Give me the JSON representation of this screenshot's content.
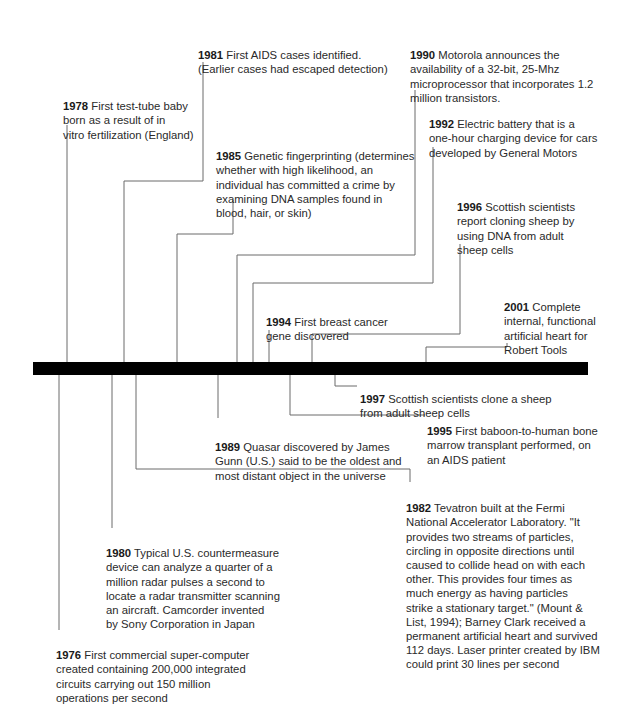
{
  "timeline": {
    "bar_color": "#000000",
    "line_color": "#6a6a6a",
    "events": [
      {
        "year": "1976",
        "text": "First commercial super-computer\ncreated containing 200,000 integrated\ncircuits carrying out 150 million\noperations per second"
      },
      {
        "year": "1978",
        "text": "First test-tube baby\nborn as a result of in\nvitro fertilization (England)"
      },
      {
        "year": "1980",
        "text": "Typical U.S. countermeasure\ndevice can analyze a quarter of a\nmillion radar pulses a second to\nlocate a radar transmitter scanning\nan aircraft. Camcorder invented\nby Sony Corporation in Japan"
      },
      {
        "year": "1981",
        "text": "First AIDS cases identified.\n(Earlier cases had escaped detection)"
      },
      {
        "year": "1982",
        "text": "Tevatron built at the Fermi\nNational Accelerator Laboratory. \"It\nprovides two streams of particles,\ncircling in opposite directions until\ncaused to collide head on with each\nother. This provides four times as\nmuch energy as having particles\nstrike a stationary target.\" (Mount &\nList, 1994); Barney Clark received a\npermanent artificial heart and survived\n112 days.  Laser printer created by IBM\ncould print 30 lines per second"
      },
      {
        "year": "1985",
        "text": "Genetic fingerprinting (determines\nwhether with high likelihood, an\nindividual has committed a crime by\nexamining DNA samples found in\nblood, hair, or skin)"
      },
      {
        "year": "1989",
        "text": "Quasar discovered by James\nGunn (U.S.) said to be the oldest and\nmost distant object in the universe"
      },
      {
        "year": "1990",
        "text": "Motorola announces the\navailability of a 32-bit, 25-Mhz\nmicroprocessor that incorporates 1.2\nmillion transistors."
      },
      {
        "year": "1992",
        "text": "Electric battery that is a\none-hour charging device for cars\ndeveloped by General Motors"
      },
      {
        "year": "1994",
        "text": "First breast cancer\ngene discovered"
      },
      {
        "year": "1995",
        "text": "First baboon-to-human bone\nmarrow transplant performed, on\nan AIDS patient"
      },
      {
        "year": "1996",
        "text": "Scottish scientists\nreport cloning sheep by\nusing DNA from adult\nsheep cells"
      },
      {
        "year": "1997",
        "text": "Scottish scientists clone a sheep\nfrom adult sheep cells"
      },
      {
        "year": "2001",
        "text": "Complete\ninternal, functional\nartificial heart for\nRobert Tools"
      }
    ]
  }
}
